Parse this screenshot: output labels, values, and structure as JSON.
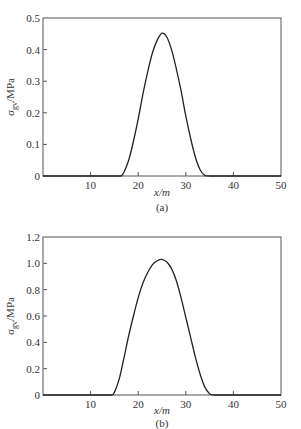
{
  "chart_data": [
    {
      "type": "line",
      "panel_label": "(a)",
      "title": "",
      "xlabel": "x/m",
      "ylabel": "σgv/MPa",
      "ylabel_main": "σ",
      "ylabel_sub": "gv",
      "ylabel_unit": "/MPa",
      "xlim": [
        0,
        50
      ],
      "ylim": [
        0,
        0.5
      ],
      "xticks": [
        10,
        20,
        30,
        40,
        50
      ],
      "xtick_labels": [
        "10",
        "20",
        "30",
        "40",
        "50"
      ],
      "yticks": [
        0,
        0.1,
        0.2,
        0.3,
        0.4,
        0.5
      ],
      "ytick_labels": [
        "0",
        "0.1",
        "0.2",
        "0.3",
        "0.4",
        "0.5"
      ],
      "grid": false,
      "legend": null,
      "series": [
        {
          "name": "σgv",
          "x": [
            0,
            5,
            10,
            15,
            16.4,
            17,
            18,
            19,
            20,
            21,
            22,
            23,
            24,
            25,
            26,
            27,
            28,
            29,
            30,
            31,
            32,
            33,
            34,
            35,
            40,
            45,
            50
          ],
          "y": [
            0,
            0,
            0,
            0,
            0,
            0.012,
            0.05,
            0.11,
            0.18,
            0.26,
            0.33,
            0.39,
            0.43,
            0.452,
            0.44,
            0.4,
            0.34,
            0.27,
            0.19,
            0.12,
            0.06,
            0.02,
            0.002,
            0,
            0,
            0,
            0
          ]
        }
      ]
    },
    {
      "type": "line",
      "panel_label": "(b)",
      "title": "",
      "xlabel": "x/m",
      "ylabel": "σgv/MPa",
      "ylabel_main": "σ",
      "ylabel_sub": "gv",
      "ylabel_unit": "/MPa",
      "xlim": [
        0,
        50
      ],
      "ylim": [
        0,
        1.2
      ],
      "xticks": [
        10,
        20,
        30,
        40,
        50
      ],
      "xtick_labels": [
        "10",
        "20",
        "30",
        "40",
        "50"
      ],
      "yticks": [
        0,
        0.2,
        0.4,
        0.6,
        0.8,
        1.0,
        1.2
      ],
      "ytick_labels": [
        "0",
        "0.2",
        "0.4",
        "0.6",
        "0.8",
        "1.0",
        "1.2"
      ],
      "grid": false,
      "legend": null,
      "series": [
        {
          "name": "σgv",
          "x": [
            0,
            5,
            10,
            14,
            14.5,
            15,
            16,
            17,
            18,
            19,
            20,
            21,
            22,
            23,
            24,
            25,
            26,
            27,
            28,
            29,
            30,
            31,
            32,
            33,
            34,
            35,
            36,
            40,
            45,
            50
          ],
          "y": [
            0,
            0,
            0,
            0,
            0,
            0.02,
            0.12,
            0.28,
            0.45,
            0.6,
            0.74,
            0.85,
            0.93,
            0.99,
            1.02,
            1.03,
            1.01,
            0.96,
            0.87,
            0.74,
            0.59,
            0.44,
            0.29,
            0.16,
            0.06,
            0.01,
            0,
            0,
            0,
            0
          ]
        }
      ]
    }
  ]
}
